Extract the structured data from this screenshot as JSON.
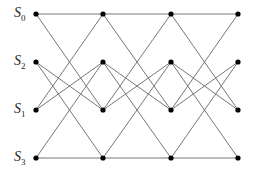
{
  "diagram": {
    "type": "trellis",
    "states": [
      {
        "label": "S",
        "sub": "0",
        "row": 0
      },
      {
        "label": "S",
        "sub": "2",
        "row": 1
      },
      {
        "label": "S",
        "sub": "1",
        "row": 2
      },
      {
        "label": "S",
        "sub": "3",
        "row": 3
      }
    ],
    "columns_x": [
      36,
      103,
      171,
      238
    ],
    "rows_y": [
      14,
      62,
      110,
      158
    ],
    "transitions": [
      [
        0,
        0
      ],
      [
        0,
        2
      ],
      [
        1,
        2
      ],
      [
        1,
        3
      ],
      [
        2,
        0
      ],
      [
        2,
        1
      ],
      [
        3,
        1
      ],
      [
        3,
        3
      ]
    ],
    "line_color": "#777777",
    "node_color": "#000000"
  }
}
